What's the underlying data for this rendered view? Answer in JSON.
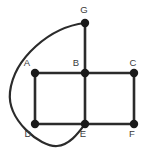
{
  "figure": {
    "name": "undirected-graph-diagram",
    "width": 148,
    "height": 157,
    "background_color": "#ffffff",
    "stroke_color": "#2b2b2b",
    "vertex_color": "#1a1a1a",
    "label_color": "#3a3a3a"
  },
  "graph_data": {
    "type": "graph",
    "directed": false,
    "vertex_count": 7,
    "edge_count": 9,
    "vertices": [
      {
        "id": "G",
        "label": "G",
        "x": 85,
        "y": 23,
        "radius": 4.2,
        "label_x": 84,
        "label_y": 13,
        "label_anchor": "middle",
        "label_position": "above"
      },
      {
        "id": "A",
        "label": "A",
        "x": 35,
        "y": 73,
        "radius": 4.2,
        "label_x": 27,
        "label_y": 66,
        "label_anchor": "middle",
        "label_position": "above-left"
      },
      {
        "id": "B",
        "label": "B",
        "x": 85,
        "y": 73,
        "radius": 4.2,
        "label_x": 76,
        "label_y": 66,
        "label_anchor": "middle",
        "label_position": "above-left"
      },
      {
        "id": "C",
        "label": "C",
        "x": 134,
        "y": 73,
        "radius": 4.2,
        "label_x": 133,
        "label_y": 66,
        "label_anchor": "middle",
        "label_position": "above-left"
      },
      {
        "id": "D",
        "label": "D",
        "x": 35,
        "y": 124,
        "radius": 4.2,
        "label_x": 28,
        "label_y": 137,
        "label_anchor": "middle",
        "label_position": "below-left"
      },
      {
        "id": "E",
        "label": "E",
        "x": 85,
        "y": 124,
        "radius": 4.2,
        "label_x": 83,
        "label_y": 137,
        "label_anchor": "middle",
        "label_position": "below-left"
      },
      {
        "id": "F",
        "label": "F",
        "x": 134,
        "y": 124,
        "radius": 4.2,
        "label_x": 132,
        "label_y": 137,
        "label_anchor": "middle",
        "label_position": "below-left"
      }
    ],
    "edges": [
      {
        "id": "edge-g-b",
        "from": "G",
        "to": "B",
        "shape": "straight",
        "path": "M 85 23 L 85 73"
      },
      {
        "id": "edge-a-b",
        "from": "A",
        "to": "B",
        "shape": "straight",
        "path": "M 35 73 L 85 73"
      },
      {
        "id": "edge-b-c",
        "from": "B",
        "to": "C",
        "shape": "straight",
        "path": "M 85 73 L 134 73"
      },
      {
        "id": "edge-a-d",
        "from": "A",
        "to": "D",
        "shape": "straight",
        "path": "M 35 73 L 35 124"
      },
      {
        "id": "edge-b-e",
        "from": "B",
        "to": "E",
        "shape": "straight",
        "path": "M 85 73 L 85 124"
      },
      {
        "id": "edge-c-f",
        "from": "C",
        "to": "F",
        "shape": "straight",
        "path": "M 134 73 L 134 124"
      },
      {
        "id": "edge-d-e",
        "from": "D",
        "to": "E",
        "shape": "straight",
        "path": "M 35 124 L 85 124"
      },
      {
        "id": "edge-e-f",
        "from": "E",
        "to": "F",
        "shape": "straight",
        "path": "M 85 124 L 134 124"
      },
      {
        "id": "edge-g-e-curved",
        "from": "G",
        "to": "E",
        "shape": "curved",
        "note": "long arc sweeping left of A and below D",
        "path": "M 85 23 C 50 27 14 58 10 92 C 7 120 40 147 57 146 C 70 145 79 132 85 124"
      }
    ],
    "adjacency": {
      "A": [
        "B",
        "D"
      ],
      "B": [
        "A",
        "C",
        "E",
        "G"
      ],
      "C": [
        "B",
        "F"
      ],
      "D": [
        "A",
        "E"
      ],
      "E": [
        "B",
        "D",
        "F",
        "G"
      ],
      "F": [
        "C",
        "E"
      ],
      "G": [
        "B",
        "E"
      ]
    }
  }
}
